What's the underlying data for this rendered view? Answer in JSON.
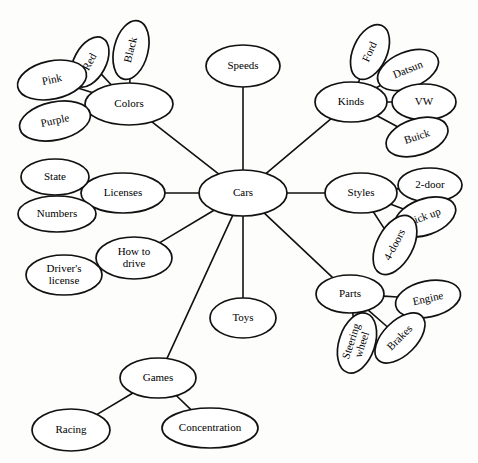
{
  "diagram": {
    "type": "semantic-web",
    "background_color": "#fdfdfb",
    "node_fill": "#ffffff",
    "stroke_color": "#111111",
    "nodes": [
      {
        "id": "cars",
        "label": "Cars",
        "cx": 243,
        "cy": 193,
        "rx": 44,
        "ry": 23,
        "rot": 0,
        "font": 12.5,
        "lines": [
          "Cars"
        ]
      },
      {
        "id": "speeds",
        "label": "Speeds",
        "cx": 243,
        "cy": 66,
        "rx": 37,
        "ry": 21,
        "rot": 0,
        "font": 11,
        "lines": [
          "Speeds"
        ]
      },
      {
        "id": "colors",
        "label": "Colors",
        "cx": 129,
        "cy": 104,
        "rx": 44,
        "ry": 21,
        "rot": 0,
        "font": 11.5,
        "lines": [
          "Colors"
        ]
      },
      {
        "id": "red",
        "label": "Red",
        "cx": 90,
        "cy": 62,
        "rx": 27,
        "ry": 16,
        "rot": -62,
        "font": 10.5,
        "lines": [
          "Red"
        ]
      },
      {
        "id": "black",
        "label": "Black",
        "cx": 131,
        "cy": 50,
        "rx": 30,
        "ry": 17,
        "rot": -76,
        "font": 10.5,
        "lines": [
          "Black"
        ]
      },
      {
        "id": "pink",
        "label": "Pink",
        "cx": 52,
        "cy": 80,
        "rx": 35,
        "ry": 19,
        "rot": -12,
        "font": 11,
        "lines": [
          "Pink"
        ]
      },
      {
        "id": "purple",
        "label": "Purple",
        "cx": 55,
        "cy": 121,
        "rx": 36,
        "ry": 19,
        "rot": -12,
        "font": 11,
        "lines": [
          "Purple"
        ]
      },
      {
        "id": "licenses",
        "label": "Licenses",
        "cx": 123,
        "cy": 193,
        "rx": 42,
        "ry": 20,
        "rot": 0,
        "font": 11.5,
        "lines": [
          "Licenses"
        ]
      },
      {
        "id": "state",
        "label": "State",
        "cx": 55,
        "cy": 177,
        "rx": 34,
        "ry": 18,
        "rot": 0,
        "font": 11,
        "lines": [
          "State"
        ]
      },
      {
        "id": "numbers",
        "label": "Numbers",
        "cx": 57,
        "cy": 214,
        "rx": 39,
        "ry": 18,
        "rot": 0,
        "font": 11,
        "lines": [
          "Numbers"
        ]
      },
      {
        "id": "how-to-drive",
        "label": "How to drive",
        "cx": 134,
        "cy": 258,
        "rx": 38,
        "ry": 21,
        "rot": 0,
        "font": 11,
        "lines": [
          "How to",
          "drive"
        ]
      },
      {
        "id": "drivers-license",
        "label": "Driver's license",
        "cx": 64,
        "cy": 275,
        "rx": 38,
        "ry": 20,
        "rot": 0,
        "font": 10.5,
        "lines": [
          "Driver's",
          "license"
        ]
      },
      {
        "id": "toys",
        "label": "Toys",
        "cx": 243,
        "cy": 318,
        "rx": 33,
        "ry": 20,
        "rot": 0,
        "font": 11,
        "lines": [
          "Toys"
        ]
      },
      {
        "id": "games",
        "label": "Games",
        "cx": 158,
        "cy": 378,
        "rx": 38,
        "ry": 20,
        "rot": 0,
        "font": 11.5,
        "lines": [
          "Games"
        ]
      },
      {
        "id": "racing",
        "label": "Racing",
        "cx": 71,
        "cy": 430,
        "rx": 39,
        "ry": 21,
        "rot": 0,
        "font": 11.5,
        "lines": [
          "Racing"
        ]
      },
      {
        "id": "concentration",
        "label": "Concentration",
        "cx": 210,
        "cy": 428,
        "rx": 48,
        "ry": 20,
        "rot": 0,
        "font": 11,
        "lines": [
          "Concentration"
        ]
      },
      {
        "id": "kinds",
        "label": "Kinds",
        "cx": 351,
        "cy": 102,
        "rx": 36,
        "ry": 20,
        "rot": 0,
        "font": 11.5,
        "lines": [
          "Kinds"
        ]
      },
      {
        "id": "ford",
        "label": "Ford",
        "cx": 370,
        "cy": 52,
        "rx": 29,
        "ry": 17,
        "rot": -66,
        "font": 10.5,
        "lines": [
          "Ford"
        ]
      },
      {
        "id": "datsun",
        "label": "Datsun",
        "cx": 408,
        "cy": 70,
        "rx": 32,
        "ry": 18,
        "rot": -22,
        "font": 10.5,
        "lines": [
          "Datsun"
        ]
      },
      {
        "id": "vw",
        "label": "VW",
        "cx": 424,
        "cy": 102,
        "rx": 32,
        "ry": 18,
        "rot": 0,
        "font": 11,
        "lines": [
          "VW"
        ]
      },
      {
        "id": "buick",
        "label": "Buick",
        "cx": 417,
        "cy": 137,
        "rx": 32,
        "ry": 18,
        "rot": -18,
        "font": 11,
        "lines": [
          "Buick"
        ]
      },
      {
        "id": "styles",
        "label": "Styles",
        "cx": 361,
        "cy": 193,
        "rx": 36,
        "ry": 20,
        "rot": 0,
        "font": 11.5,
        "lines": [
          "Styles"
        ]
      },
      {
        "id": "2-door",
        "label": "2-door",
        "cx": 430,
        "cy": 185,
        "rx": 32,
        "ry": 17,
        "rot": 0,
        "font": 11,
        "lines": [
          "2-door"
        ]
      },
      {
        "id": "pick-up",
        "label": "pick up",
        "cx": 425,
        "cy": 217,
        "rx": 32,
        "ry": 18,
        "rot": -20,
        "font": 11,
        "lines": [
          "pick up"
        ]
      },
      {
        "id": "4-doors",
        "label": "4-doors",
        "cx": 395,
        "cy": 245,
        "rx": 32,
        "ry": 18,
        "rot": -62,
        "font": 10.5,
        "lines": [
          "4-doors"
        ]
      },
      {
        "id": "parts",
        "label": "Parts",
        "cx": 350,
        "cy": 294,
        "rx": 34,
        "ry": 19,
        "rot": 0,
        "font": 11.5,
        "lines": [
          "Parts"
        ]
      },
      {
        "id": "engine",
        "label": "Engine",
        "cx": 428,
        "cy": 299,
        "rx": 33,
        "ry": 18,
        "rot": -12,
        "font": 11,
        "lines": [
          "Engine"
        ]
      },
      {
        "id": "brakes",
        "label": "Brakes",
        "cx": 400,
        "cy": 338,
        "rx": 31,
        "ry": 17,
        "rot": -45,
        "font": 10.5,
        "lines": [
          "Brakes"
        ]
      },
      {
        "id": "steering-wheel",
        "label": "Steering wheel",
        "cx": 357,
        "cy": 343,
        "rx": 31,
        "ry": 18,
        "rot": -72,
        "font": 10,
        "lines": [
          "Steering",
          "wheel"
        ]
      }
    ],
    "edges": [
      {
        "from": "cars",
        "to": "speeds"
      },
      {
        "from": "cars",
        "to": "colors"
      },
      {
        "from": "cars",
        "to": "licenses"
      },
      {
        "from": "cars",
        "to": "how-to-drive"
      },
      {
        "from": "cars",
        "to": "games"
      },
      {
        "from": "cars",
        "to": "toys"
      },
      {
        "from": "cars",
        "to": "kinds"
      },
      {
        "from": "cars",
        "to": "styles"
      },
      {
        "from": "cars",
        "to": "parts"
      },
      {
        "from": "colors",
        "to": "red"
      },
      {
        "from": "colors",
        "to": "black"
      },
      {
        "from": "colors",
        "to": "pink"
      },
      {
        "from": "colors",
        "to": "purple"
      },
      {
        "from": "licenses",
        "to": "state"
      },
      {
        "from": "licenses",
        "to": "numbers"
      },
      {
        "from": "how-to-drive",
        "to": "drivers-license"
      },
      {
        "from": "games",
        "to": "racing"
      },
      {
        "from": "games",
        "to": "concentration"
      },
      {
        "from": "kinds",
        "to": "ford"
      },
      {
        "from": "kinds",
        "to": "datsun"
      },
      {
        "from": "kinds",
        "to": "vw"
      },
      {
        "from": "kinds",
        "to": "buick"
      },
      {
        "from": "styles",
        "to": "2-door"
      },
      {
        "from": "styles",
        "to": "pick-up"
      },
      {
        "from": "styles",
        "to": "4-doors"
      },
      {
        "from": "parts",
        "to": "engine"
      },
      {
        "from": "parts",
        "to": "brakes"
      },
      {
        "from": "parts",
        "to": "steering-wheel"
      }
    ]
  }
}
